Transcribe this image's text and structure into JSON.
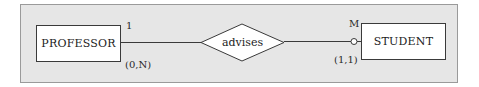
{
  "diagram": {
    "type": "ER diagram",
    "entities": [
      {
        "name": "PROFESSOR"
      },
      {
        "name": "STUDENT"
      }
    ],
    "relationship": {
      "name": "advises"
    },
    "cardinalities": {
      "professor_side": "1",
      "student_side": "M"
    },
    "participation": {
      "professor_side": "(0,N)",
      "student_side": "(1,1)"
    },
    "colors": {
      "panel_bg": "#e6e6e6",
      "panel_border": "#9a9a9a",
      "shape_fill": "#ffffff",
      "line": "#3a3a3a"
    }
  }
}
